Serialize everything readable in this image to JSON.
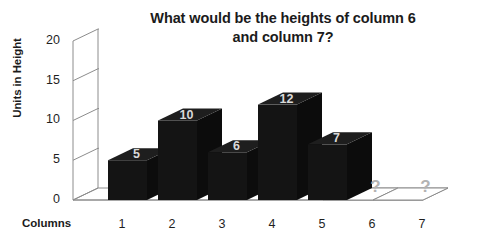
{
  "chart_data": {
    "type": "bar",
    "title": "What would be the heights of column 6\nand column 7?",
    "xlabel": "Columns",
    "ylabel": "Units in Height",
    "categories": [
      "1",
      "2",
      "3",
      "4",
      "5",
      "6",
      "7"
    ],
    "values": [
      5,
      10,
      6,
      12,
      7,
      null,
      null
    ],
    "bar_labels": [
      "5",
      "10",
      "6",
      "12",
      "7",
      "?",
      "?"
    ],
    "missing_label": "?",
    "ylim": [
      0,
      20
    ],
    "ytick_labels": [
      "0",
      "5",
      "10",
      "15",
      "20"
    ],
    "ytick_values": [
      0,
      5,
      10,
      15,
      20
    ],
    "grid": true,
    "legend": false,
    "legend_position": "none",
    "three_d": true,
    "bar_color": "#141414",
    "bar_top_color": "#1e1e1e",
    "bar_side_color": "#0c0c0c",
    "bar_label_color": "#d9d9d9",
    "missing_label_color": "#b3b3b3",
    "axis_color": "#8c8c8c",
    "text_color": "#1b1b1b",
    "background_color": "#ffffff",
    "annotations": [
      {
        "at_category": "6",
        "text": "?"
      },
      {
        "at_category": "7",
        "text": "?"
      }
    ]
  },
  "ytick_label_positions": [
    {
      "label": "0",
      "top": 192
    },
    {
      "label": "5",
      "top": 152
    },
    {
      "label": "10",
      "top": 112
    },
    {
      "label": "15",
      "top": 73
    },
    {
      "label": "20",
      "top": 33
    }
  ],
  "xtick_label_positions": [
    {
      "label": "1",
      "left": 112
    },
    {
      "label": "2",
      "left": 162
    },
    {
      "label": "3",
      "left": 212
    },
    {
      "label": "4",
      "left": 262
    },
    {
      "label": "5",
      "left": 312
    },
    {
      "label": "6",
      "left": 362
    },
    {
      "label": "7",
      "left": 412
    }
  ]
}
